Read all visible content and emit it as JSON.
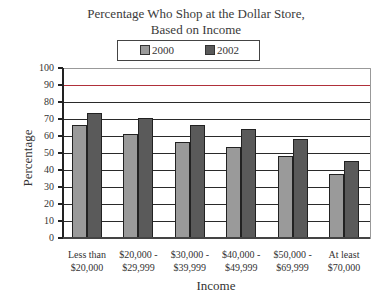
{
  "chart_data": {
    "type": "bar",
    "title_lines": [
      "Percentage Who Shop at the Dollar Store,",
      "Based on Income"
    ],
    "xlabel": "Income",
    "ylabel": "Percentage",
    "ylim": [
      0,
      100
    ],
    "yticks": [
      0,
      10,
      20,
      30,
      40,
      50,
      60,
      70,
      80,
      90,
      100
    ],
    "grid": true,
    "legend_position": "top",
    "categories": [
      "Less than $20,000",
      "$20,000 - $29,999",
      "$30,000 - $39,999",
      "$40,000 - $49,999",
      "$50,000 - $69,999",
      "At least $70,000"
    ],
    "category_lines": [
      [
        "Less than",
        "$20,000"
      ],
      [
        "$20,000 -",
        "$29,999"
      ],
      [
        "$30,000 -",
        "$39,999"
      ],
      [
        "$40,000 -",
        "$49,999"
      ],
      [
        "$50,000 -",
        "$69,999"
      ],
      [
        "At least",
        "$70,000"
      ]
    ],
    "series": [
      {
        "name": "2000",
        "color": "#9a9a9a",
        "values": [
          67,
          62,
          57,
          54,
          49,
          38
        ]
      },
      {
        "name": "2002",
        "color": "#5a5a5a",
        "values": [
          74,
          71,
          67,
          65,
          59,
          46
        ]
      }
    ]
  }
}
